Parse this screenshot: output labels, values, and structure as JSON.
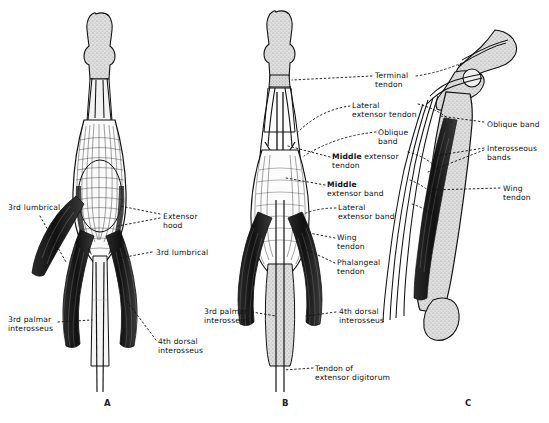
{
  "figure": {
    "background_color": "#ffffff",
    "ink_color": "#111111",
    "bone_fill": "#d9d9d9",
    "panels": [
      {
        "id": "A",
        "letter": "A",
        "view": "dorsal view of extensor hood",
        "letter_x": 104,
        "letter_y": 398
      },
      {
        "id": "B",
        "letter": "B",
        "view": "dorsal view of extensor bands",
        "letter_x": 282,
        "letter_y": 398
      },
      {
        "id": "C",
        "letter": "C",
        "view": "lateral view of flexed finger",
        "letter_x": 465,
        "letter_y": 398
      }
    ],
    "labels_panel_a": [
      {
        "name": "3rd lumbrical",
        "text": "3rd lumbrical",
        "x": 8,
        "y": 203,
        "align": "left"
      },
      {
        "name": "extensor-hood",
        "text": "Extensor\nhood",
        "x": 163,
        "y": 212,
        "align": "left"
      },
      {
        "name": "3rd lumbrical right",
        "text": "3rd lumbrical",
        "x": 156,
        "y": 248,
        "align": "left"
      },
      {
        "name": "3rd palmar interosseus",
        "text": "3rd palmar\ninterosseus",
        "x": 8,
        "y": 315,
        "align": "left"
      },
      {
        "name": "4th dorsal interosseus",
        "text": "4th dorsal\ninterosseus",
        "x": 158,
        "y": 337,
        "align": "left"
      }
    ],
    "labels_panel_b": [
      {
        "name": "terminal-tendon",
        "text": "Terminal\ntendon",
        "x": 375,
        "y": 71,
        "align": "left"
      },
      {
        "name": "lateral-extensor-tendon",
        "text": "Lateral\nextensor tendon",
        "x": 352,
        "y": 101,
        "align": "left"
      },
      {
        "name": "oblique-band",
        "text": "Oblique\nband",
        "x": 378,
        "y": 128,
        "align": "left"
      },
      {
        "name": "middle-extensor-tendon",
        "text": "Middle extensor\ntendon",
        "x": 332,
        "y": 152,
        "align": "left",
        "bold_first": true
      },
      {
        "name": "middle-extensor-band",
        "text": "Middle\nextensor band",
        "x": 327,
        "y": 180,
        "align": "left",
        "bold_first": true
      },
      {
        "name": "lateral-extensor-band",
        "text": "Lateral\nextensor band",
        "x": 338,
        "y": 203,
        "align": "left"
      },
      {
        "name": "wing-tendon",
        "text": "Wing\ntendon",
        "x": 337,
        "y": 233,
        "align": "left"
      },
      {
        "name": "phalangeal-tendon",
        "text": "Phalangeal\ntendon",
        "x": 337,
        "y": 258,
        "align": "left"
      },
      {
        "name": "3rd-palmar-interosseus",
        "text": "3rd palmar\ninterosseus",
        "x": 204,
        "y": 307,
        "align": "left"
      },
      {
        "name": "4th-dorsal-interosseus",
        "text": "4th dorsal\ninterosseus",
        "x": 339,
        "y": 307,
        "align": "left"
      },
      {
        "name": "tendon-of-extensor-digitorum",
        "text": "Tendon of\nextensor digitorum",
        "x": 315,
        "y": 364,
        "align": "left"
      }
    ],
    "labels_panel_c": [
      {
        "name": "oblique-band",
        "text": "Oblique band",
        "x": 487,
        "y": 120,
        "align": "left"
      },
      {
        "name": "interosseous-bands",
        "text": "Interosseous\nbands",
        "x": 487,
        "y": 144,
        "align": "left"
      },
      {
        "name": "wing-tendon",
        "text": "Wing\ntendon",
        "x": 503,
        "y": 184,
        "align": "left"
      }
    ]
  }
}
